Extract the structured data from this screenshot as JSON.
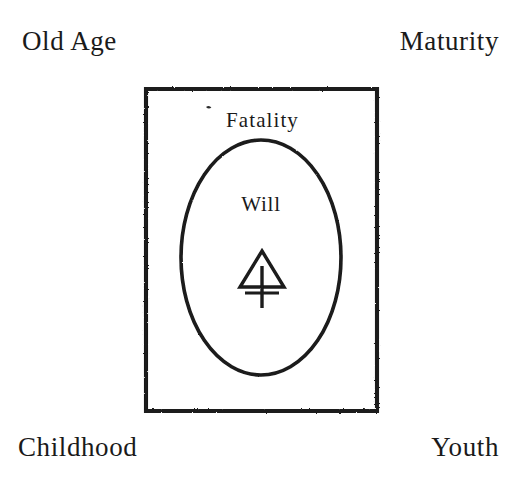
{
  "figure": {
    "background_color": "#ffffff",
    "ink_color": "#1a1a1a",
    "corner_labels": [
      {
        "key": "old_age",
        "text": "Old Age",
        "position": "top-left"
      },
      {
        "key": "maturity",
        "text": "Maturity",
        "position": "top-right"
      },
      {
        "key": "childhood",
        "text": "Childhood",
        "position": "bottom-left"
      },
      {
        "key": "youth",
        "text": "Youth",
        "position": "bottom-right"
      }
    ],
    "plate": {
      "outer_shape": "rectangle",
      "outer_bounds": {
        "x": 145,
        "y": 88,
        "width": 233,
        "height": 324
      },
      "inner_shape": "ellipse",
      "inner_bounds": {
        "cx": 261,
        "cy": 257,
        "rx": 80,
        "ry": 117
      }
    },
    "inner_labels": [
      {
        "key": "fatality",
        "text": "Fatality"
      },
      {
        "key": "will",
        "text": "Will"
      }
    ],
    "symbol": {
      "name": "alchemical-sulfur-symbol",
      "description": "triangle above a cross",
      "bounds": {
        "x": 240,
        "y": 250,
        "width": 44,
        "height": 58
      }
    },
    "ink_speck": {
      "x": 208,
      "y": 106
    }
  }
}
